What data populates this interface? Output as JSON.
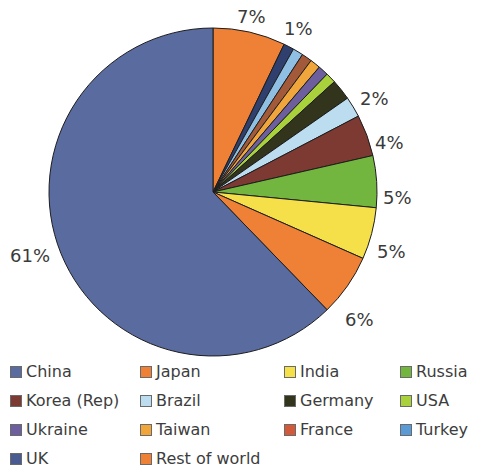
{
  "watermark": "www.explainthatstuff.com",
  "chart_data": {
    "type": "pie",
    "title": "",
    "subtitle": "",
    "xlabel": "",
    "ylabel": "",
    "legend_position": "bottom",
    "grid": false,
    "units": "percent",
    "start_angle_deg": 0,
    "direction": "clockwise",
    "categories": [
      "Japan",
      "UK",
      "Turkey",
      "France",
      "Taiwan",
      "Ukraine",
      "USA",
      "Germany",
      "Brazil",
      "Korea (Rep)",
      "Russia",
      "India",
      "Rest of world",
      "China"
    ],
    "values": [
      7,
      1,
      1,
      1,
      1,
      1,
      1,
      2,
      2,
      4,
      5,
      5,
      6,
      61
    ],
    "colors": [
      "#ef8137",
      "#2f3f6e",
      "#8fc0e4",
      "#a35a3a",
      "#f0a63a",
      "#6d5f9e",
      "#a8d13c",
      "#33341c",
      "#bcdcf0",
      "#7d3a33",
      "#73b63f",
      "#f5e04a",
      "#ef8137",
      "#5a6ba0"
    ],
    "slices": [
      {
        "label": "Japan",
        "value": 7,
        "color": "#ef8137",
        "displayed_label": "7%",
        "labelled": true
      },
      {
        "label": "UK",
        "value": 1,
        "color": "#2f3f6e",
        "displayed_label": "",
        "labelled": false
      },
      {
        "label": "Turkey",
        "value": 1,
        "color": "#8fc0e4",
        "displayed_label": "1%",
        "labelled": true
      },
      {
        "label": "France",
        "value": 1,
        "color": "#a35a3a",
        "displayed_label": "",
        "labelled": false
      },
      {
        "label": "Taiwan",
        "value": 1,
        "color": "#f0a63a",
        "displayed_label": "",
        "labelled": false
      },
      {
        "label": "Ukraine",
        "value": 1,
        "color": "#6d5f9e",
        "displayed_label": "",
        "labelled": false
      },
      {
        "label": "USA",
        "value": 1,
        "color": "#a8d13c",
        "displayed_label": "",
        "labelled": false
      },
      {
        "label": "Germany",
        "value": 2,
        "color": "#33341c",
        "displayed_label": "2%",
        "labelled": true
      },
      {
        "label": "Brazil",
        "value": 2,
        "color": "#bcdcf0",
        "displayed_label": "",
        "labelled": false
      },
      {
        "label": "Korea (Rep)",
        "value": 4,
        "color": "#7d3a33",
        "displayed_label": "4%",
        "labelled": true
      },
      {
        "label": "Russia",
        "value": 5,
        "color": "#73b63f",
        "displayed_label": "5%",
        "labelled": true
      },
      {
        "label": "India",
        "value": 5,
        "color": "#f5e04a",
        "displayed_label": "5%",
        "labelled": true
      },
      {
        "label": "Rest of world",
        "value": 6,
        "color": "#ef8137",
        "displayed_label": "6%",
        "labelled": true
      },
      {
        "label": "China",
        "value": 61,
        "color": "#5a6ba0",
        "displayed_label": "61%",
        "labelled": true
      }
    ],
    "data_labels": [
      {
        "text": "7%",
        "x": 237,
        "y": 6,
        "for": "Japan"
      },
      {
        "text": "1%",
        "x": 284,
        "y": 18,
        "for": "Turkey"
      },
      {
        "text": "2%",
        "x": 360,
        "y": 88,
        "for": "Germany"
      },
      {
        "text": "4%",
        "x": 375,
        "y": 132,
        "for": "Korea (Rep)"
      },
      {
        "text": "5%",
        "x": 383,
        "y": 187,
        "for": "Russia"
      },
      {
        "text": "5%",
        "x": 377,
        "y": 241,
        "for": "India"
      },
      {
        "text": "6%",
        "x": 345,
        "y": 309,
        "for": "Rest of world"
      },
      {
        "text": "61%",
        "x": 10,
        "y": 245,
        "for": "China"
      }
    ],
    "geometry": {
      "center_x": 213,
      "center_y": 192,
      "radius": 164
    }
  },
  "legend": {
    "columns": 4,
    "rows": [
      [
        {
          "label": "China",
          "color": "#5a6ba0",
          "x": 10,
          "name": "legend-item-china"
        },
        {
          "label": "Japan",
          "color": "#ef8137",
          "x": 140,
          "name": "legend-item-japan"
        },
        {
          "label": "India",
          "color": "#f5e04a",
          "x": 284,
          "name": "legend-item-india"
        },
        {
          "label": "Russia",
          "color": "#73b63f",
          "x": 400,
          "name": "legend-item-russia"
        }
      ],
      [
        {
          "label": "Korea (Rep)",
          "color": "#7d3a33",
          "x": 10,
          "name": "legend-item-korea"
        },
        {
          "label": "Brazil",
          "color": "#bcdcf0",
          "x": 140,
          "name": "legend-item-brazil"
        },
        {
          "label": "Germany",
          "color": "#33341c",
          "x": 284,
          "name": "legend-item-germany"
        },
        {
          "label": "USA",
          "color": "#a8d13c",
          "x": 400,
          "name": "legend-item-usa"
        }
      ],
      [
        {
          "label": "Ukraine",
          "color": "#6d5f9e",
          "x": 10,
          "name": "legend-item-ukraine"
        },
        {
          "label": "Taiwan",
          "color": "#f0a63a",
          "x": 140,
          "name": "legend-item-taiwan"
        },
        {
          "label": "France",
          "color": "#d15a3a",
          "x": 284,
          "name": "legend-item-france"
        },
        {
          "label": "Turkey",
          "color": "#5b9bd5",
          "x": 400,
          "name": "legend-item-turkey"
        }
      ],
      [
        {
          "label": "UK",
          "color": "#4a5b92",
          "x": 10,
          "name": "legend-item-uk"
        },
        {
          "label": "Rest of world",
          "color": "#ef8137",
          "x": 140,
          "name": "legend-item-rest-of-world"
        }
      ]
    ]
  }
}
